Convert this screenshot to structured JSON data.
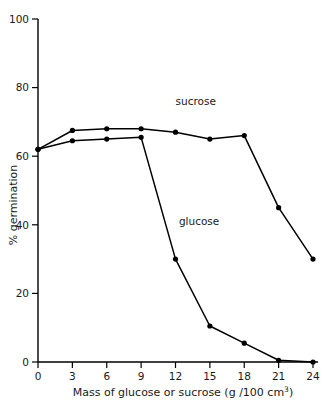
{
  "chart_data": {
    "type": "line",
    "title": "",
    "xlabel": "Mass of glucose or sucrose  (g /100 cm3)",
    "xlabel_main": "Mass of glucose or sucrose  (g /100 cm",
    "xlabel_sup": "3",
    "xlabel_tail": ")",
    "ylabel": "% germination",
    "x": [
      0,
      3,
      6,
      9,
      12,
      15,
      18,
      21,
      24
    ],
    "xlim": [
      0,
      24
    ],
    "ylim": [
      0,
      100
    ],
    "xticks": [
      "0",
      "3",
      "6",
      "9",
      "12",
      "15",
      "18",
      "21",
      "24"
    ],
    "yticks": [
      "0",
      "20",
      "40",
      "60",
      "80",
      "100"
    ],
    "ytick_values": [
      0,
      20,
      40,
      60,
      80,
      100
    ],
    "grid": false,
    "legend_position": "inline-annotation",
    "series": [
      {
        "name": "sucrose",
        "label": "sucrose",
        "color": "#000000",
        "marker": "filled-circle",
        "values": [
          62,
          67.5,
          68,
          68,
          67,
          65,
          66,
          45,
          30
        ],
        "annotation": {
          "text": "sucrose",
          "x": 12,
          "y": 75
        }
      },
      {
        "name": "glucose",
        "label": "glucose",
        "color": "#000000",
        "marker": "filled-circle",
        "values": [
          62,
          64.5,
          65,
          65.5,
          30,
          10.5,
          5.5,
          0.5,
          0
        ],
        "annotation": {
          "text": "glucose",
          "x": 12.3,
          "y": 40
        }
      }
    ]
  },
  "figure": {
    "background": "#ffffff",
    "line_color": "#000000",
    "axis_color": "#000000"
  }
}
